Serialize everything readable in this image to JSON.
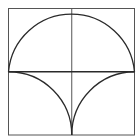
{
  "diagram": {
    "type": "geometric-construction",
    "stroke_color": "#2a2a2a",
    "thin_stroke_color": "#555555",
    "background": "#ffffff",
    "square": {
      "x": 8.5,
      "y": 8.5,
      "size": 126.5
    },
    "midlines": {
      "vertical_x": 71.75,
      "horizontal_y": 71.75
    },
    "semicircle": {
      "cx": 71.75,
      "cy": 71.75,
      "r": 63.25
    },
    "lower_arcs": [
      {
        "name": "left",
        "center": [
          8.5,
          135
        ],
        "r": 63.25
      },
      {
        "name": "right",
        "center": [
          135,
          135
        ],
        "r": 63.25
      }
    ]
  }
}
